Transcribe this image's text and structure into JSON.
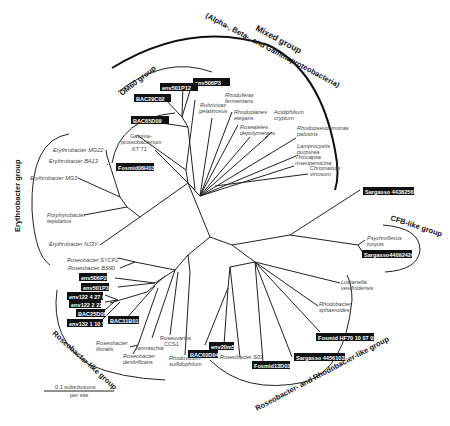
{
  "figure": {
    "type": "unrooted phylogenetic tree",
    "scale_bar": {
      "label_line1": "0.1 substitutions",
      "label_line2": "per site"
    }
  },
  "groups": {
    "mixed": {
      "title": "Mixed group",
      "subtitle": "(Alpha-, Beta-, and Gammaproteobacteria)"
    },
    "om60": {
      "title": "OM60 group"
    },
    "erythrobacter": {
      "title": "Erythrobacter group"
    },
    "cfb": {
      "title": "CFB-like group"
    },
    "roseobacter_like": {
      "title": "Roseobacter-like group"
    },
    "roseo_rhodo": {
      "title": "Roseobacter- and Rhodobacter-like group"
    }
  },
  "clones": {
    "env506P3": "env506P3",
    "env501P12": "env501P12",
    "BAC29C02": "BAC29C02",
    "BAC65D09": "BAC65D09",
    "Fosmid06H03": "Fosmid06H03",
    "Sargasso44382567": "Sargasso 44382567",
    "Sargasso44092426": "Sargasso44092426",
    "env506P2": "env506P2",
    "env501P3": "env501P3",
    "env122_4_27_0": "env122 4 27 0",
    "env122_2_22": "env122 2 22",
    "BAC25D08": "BAC25D08",
    "env132_1_10_5": "env132 1 10 5",
    "BAC31B01": "BAC31B01",
    "BAC60D04": "BAC60D04",
    "env20m5": "env20m5",
    "Fosmid13D03": "Fosmid13D03",
    "Sargasso44561033": "Sargasso 44561033",
    "FosmidHF70": "Fosmid HF70 10 07 02"
  },
  "taxa": {
    "rubrivivax_1": "Rubrivivax",
    "rubrivivax_2": "gelatinosus",
    "rhodoferax_1": "Rhodoferax",
    "rhodoferax_2": "fermentans",
    "rhodoplanes_1": "Rhodoplanes",
    "rhodoplanes_2": "elegans",
    "acidiphilium_1": "Acidiphilium",
    "acidiphilium_2": "cryptum",
    "roseateles_1": "Roseateles",
    "roseateles_2": "depolymerans",
    "rhodopseudomonas_1": "Rhodopseudomonas",
    "rhodopseudomonas_2": "palustris",
    "lamprocystis_1": "Lamprocystis",
    "lamprocystis_2": "purpurea",
    "thiocapsa_1": "Thiocapsa",
    "thiocapsa_2": "roseopersicina",
    "chromatium_1": "Chromatium",
    "chromatium_2": "vinosum",
    "gamma_1": "Gamma-",
    "gamma_2": "proteobacterium",
    "gamma_3": "KT 71",
    "erythro_mg22": "Erythrobacter MG22",
    "erythro_ba13": "Erythrobacter BA13",
    "erythro_mg3": "Erythrobacter MG3",
    "porphyro_1": "Porphyrobacter",
    "porphyro_2": "tepidarius",
    "erythro_nj3y": "Erythrobacter NJ3Y",
    "psychro_1": "Psychroflexus",
    "psychro_2": "torquis",
    "loktanella_1": "Loktanella",
    "loktanella_2": "vestfoldensis",
    "rhodobacter_1": "Rhodobacter",
    "rhodobacter_2": "sphaeroides",
    "roseo_sycp2": "Roseobacter SYCP2",
    "roseo_bs90": "Roseobacter BS90",
    "roseo_litoralis_1": "Roseobacter",
    "roseo_litoralis_2": "litoralis",
    "roseo_denit_1": "Roseobacter",
    "roseo_denit_2": "denitrificans",
    "jannaschia": "Jannaschia",
    "roseovarius_1": "Roseovarius",
    "roseovarius_2": "CCS1",
    "rhodovulum_1": "Rhodovulum",
    "rhodovulum_2": "sulfidophilum",
    "roseo_s03": "Roseobacter S03"
  }
}
